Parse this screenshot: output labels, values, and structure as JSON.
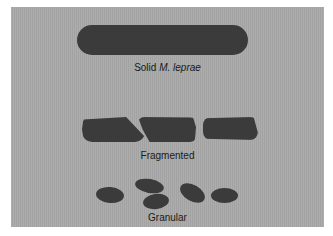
{
  "figure": {
    "background_color": "#a9a9a9",
    "shape_color": "#3b3b3b",
    "morphologies": [
      {
        "label_prefix": "Solid ",
        "label_italic": "M. leprae",
        "shape": "solid-rod"
      },
      {
        "label": "Fragmented",
        "shape": "fragmented-rod"
      },
      {
        "label": "Granular",
        "shape": "granules"
      }
    ]
  }
}
